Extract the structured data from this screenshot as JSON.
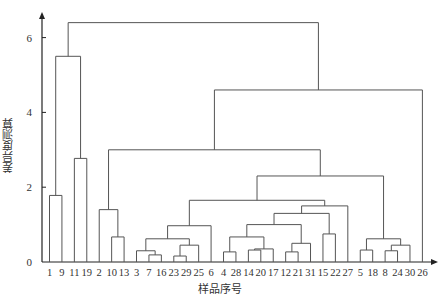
{
  "chart_data": {
    "type": "dendrogram",
    "title": "",
    "xlabel": "样品序号",
    "ylabel": "差异度测算",
    "ylim": [
      0,
      6.6
    ],
    "yticks": [
      0,
      2,
      4,
      6
    ],
    "grid": false,
    "legend": null,
    "leaves": [
      "1",
      "9",
      "11",
      "19",
      "2",
      "10",
      "13",
      "3",
      "7",
      "16",
      "23",
      "29",
      "25",
      "6",
      "4",
      "28",
      "14",
      "20",
      "17",
      "12",
      "21",
      "31",
      "15",
      "22",
      "27",
      "5",
      "18",
      "8",
      "24",
      "30",
      "26"
    ],
    "merges": [
      {
        "left": "1",
        "right": "9",
        "height": 1.78
      },
      {
        "left": "11",
        "right": "19",
        "height": 2.77
      },
      {
        "left": "(1,9)",
        "right": "(11,19)",
        "height": 5.5
      },
      {
        "left": "10",
        "right": "13",
        "height": 0.67
      },
      {
        "left": "2",
        "right": "(10,13)",
        "height": 1.4
      },
      {
        "left": "7",
        "right": "16",
        "height": 0.19
      },
      {
        "left": "3",
        "right": "(7,16)",
        "height": 0.3
      },
      {
        "left": "23",
        "right": "29",
        "height": 0.16
      },
      {
        "left": "(23,29)",
        "right": "25",
        "height": 0.45
      },
      {
        "left": "(3,7,16)",
        "right": "(23,29,25)",
        "height": 0.62
      },
      {
        "left": "(3..25)",
        "right": "6",
        "height": 0.97
      },
      {
        "left": "4",
        "right": "28",
        "height": 0.27
      },
      {
        "left": "14",
        "right": "20",
        "height": 0.32
      },
      {
        "left": "(14,20)",
        "right": "17",
        "height": 0.35
      },
      {
        "left": "(4,28)",
        "right": "(14,20,17)",
        "height": 0.67
      },
      {
        "left": "12",
        "right": "21",
        "height": 0.27
      },
      {
        "left": "(12,21)",
        "right": "31",
        "height": 0.5
      },
      {
        "left": "(4..17)",
        "right": "(12,21,31)",
        "height": 1.0
      },
      {
        "left": "15",
        "right": "22",
        "height": 0.75
      },
      {
        "left": "(4..31)",
        "right": "(15,22)",
        "height": 1.3
      },
      {
        "left": "(4..22)",
        "right": "27",
        "height": 1.5
      },
      {
        "left": "(3..6)",
        "right": "(4..27)",
        "height": 1.65
      },
      {
        "left": "5",
        "right": "18",
        "height": 0.32
      },
      {
        "left": "8",
        "right": "24",
        "height": 0.3
      },
      {
        "left": "(8,24)",
        "right": "30",
        "height": 0.45
      },
      {
        "left": "(5,18)",
        "right": "(8,24,30)",
        "height": 0.62
      },
      {
        "left": "(3..27)",
        "right": "(5..30)",
        "height": 2.3
      },
      {
        "left": "(2,10,13)",
        "right": "(3..30)",
        "height": 3.0
      },
      {
        "left": "(2..30)",
        "right": "26",
        "height": 4.6
      },
      {
        "left": "(1,9,11,19)",
        "right": "(2..26)",
        "height": 6.4
      }
    ]
  },
  "axis": {
    "ytick_labels": [
      "0",
      "2",
      "4",
      "6"
    ]
  },
  "colors": {
    "line": "#555555",
    "axis": "#222222",
    "text": "#333333"
  }
}
